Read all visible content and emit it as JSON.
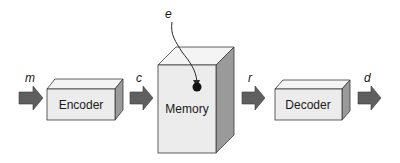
{
  "diagram": {
    "type": "block-flow",
    "direction": "left-to-right",
    "blocks": [
      {
        "id": "encoder",
        "label": "Encoder"
      },
      {
        "id": "memory",
        "label": "Memory"
      },
      {
        "id": "decoder",
        "label": "Decoder"
      }
    ],
    "signals": {
      "m": "m",
      "c": "c",
      "e": "e",
      "r": "r",
      "d": "d"
    },
    "edges": [
      {
        "from": "input",
        "to": "encoder",
        "label": "m"
      },
      {
        "from": "encoder",
        "to": "memory",
        "label": "c"
      },
      {
        "from": "external",
        "to": "memory",
        "label": "e"
      },
      {
        "from": "memory",
        "to": "decoder",
        "label": "r"
      },
      {
        "from": "decoder",
        "to": "output",
        "label": "d"
      }
    ],
    "colors": {
      "box_front": "#ececec",
      "box_top": "#f4f4f4",
      "box_side": "#9a9a9a",
      "arrow_fill": "#5f5f5f",
      "stroke": "#3a3a3a",
      "text": "#1a1a1a"
    }
  }
}
